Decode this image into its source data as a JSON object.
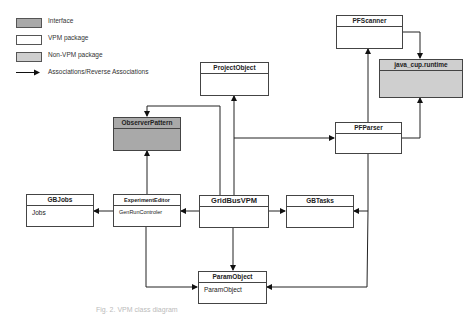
{
  "legend": {
    "items": [
      {
        "label": "Interface",
        "fill": "#a9a9a9"
      },
      {
        "label": "VPM package",
        "fill": "#ffffff"
      },
      {
        "label": "Non-VPM package",
        "fill": "#cfcfcf"
      },
      {
        "label": "Associations/Reverse Associations",
        "symbol": "arrow"
      }
    ]
  },
  "classes": {
    "pfscanner": {
      "name": "PFScanner",
      "type": "vpm",
      "body": ""
    },
    "javacup": {
      "name": "java_cup.runtime",
      "type": "non-vpm",
      "body": ""
    },
    "projectobject": {
      "name": "ProjectObject",
      "type": "vpm",
      "body": ""
    },
    "observerpattern": {
      "name": "ObserverPattern",
      "type": "interface",
      "body": ""
    },
    "pfparser": {
      "name": "PFParser",
      "type": "vpm",
      "body": ""
    },
    "gbjobs": {
      "name": "GBJobs",
      "type": "vpm",
      "body": "Jobs"
    },
    "experimenteditor": {
      "name": "ExperimentEditor",
      "type": "vpm",
      "body": "GenRunControler"
    },
    "gridbusvpm": {
      "name": "GridBusVPM",
      "type": "vpm",
      "body": ""
    },
    "gbtasks": {
      "name": "GBTasks",
      "type": "vpm",
      "body": ""
    },
    "paramobject": {
      "name": "ParamObject",
      "type": "vpm",
      "body": "ParamObject"
    }
  },
  "associations": [
    {
      "from": "PFScanner",
      "to": "java_cup.runtime"
    },
    {
      "from": "PFParser",
      "to": "java_cup.runtime"
    },
    {
      "from": "PFParser",
      "to": "PFScanner"
    },
    {
      "from": "GridBusVPM",
      "to": "ProjectObject"
    },
    {
      "from": "GridBusVPM",
      "to": "ObserverPattern"
    },
    {
      "from": "ExperimentEditor",
      "to": "ObserverPattern"
    },
    {
      "from": "GridBusVPM",
      "to": "PFParser"
    },
    {
      "from": "GridBusVPM",
      "to": "ExperimentEditor"
    },
    {
      "from": "ExperimentEditor",
      "to": "GBJobs"
    },
    {
      "from": "GridBusVPM",
      "to": "GBTasks"
    },
    {
      "from": "PFParser",
      "to": "GBTasks"
    },
    {
      "from": "GridBusVPM",
      "to": "ParamObject"
    },
    {
      "from": "ExperimentEditor",
      "to": "ParamObject"
    },
    {
      "from": "PFParser",
      "to": "ParamObject"
    }
  ],
  "caption": "Fig. 2. VPM class diagram"
}
